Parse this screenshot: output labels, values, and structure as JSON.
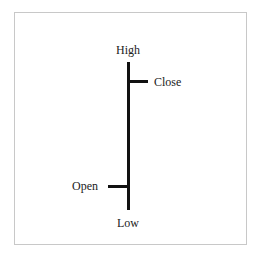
{
  "diagram": {
    "title": "",
    "type": "OHLC bar",
    "labels": {
      "high": "High",
      "close": "Close",
      "open": "Open",
      "low": "Low"
    },
    "colors": {
      "line": "#111111",
      "border": "#c8c8c8",
      "background": "#ffffff"
    }
  }
}
